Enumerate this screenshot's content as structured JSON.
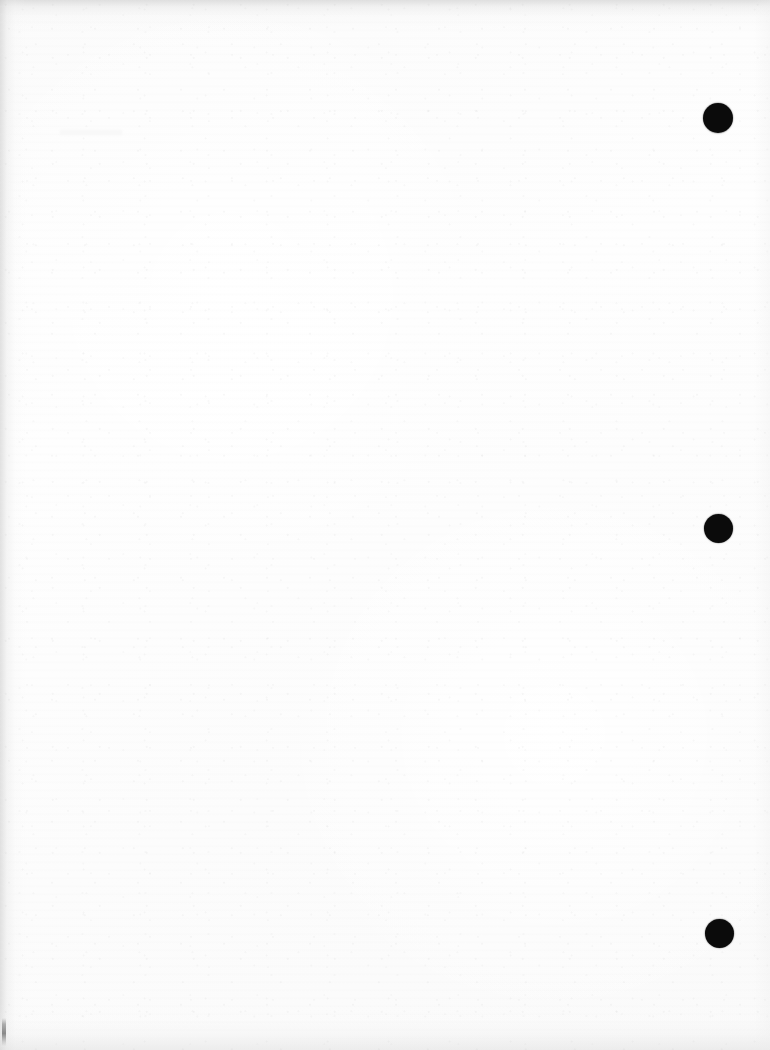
{
  "document": {
    "kind": "scanned-page",
    "description": "Blank scanned sheet with registration marks",
    "page_width": 770,
    "page_height": 1050,
    "visible_text": "",
    "background_color": "#fdfdfd",
    "mark_color": "#0b0b0b",
    "edge_shadow_color": "#cdcdcd"
  },
  "marks": {
    "label": "registration-dots",
    "count": 3,
    "shape": "circle",
    "color": "#0b0b0b",
    "items": [
      {
        "id": "dot-1",
        "cx": 718,
        "cy": 118,
        "r": 15,
        "diameter": 30
      },
      {
        "id": "dot-2",
        "cx": 718,
        "cy": 528,
        "r": 14.5,
        "diameter": 29
      },
      {
        "id": "dot-3",
        "cx": 719,
        "cy": 933,
        "r": 14.5,
        "diameter": 29
      }
    ]
  },
  "edge_artifacts": {
    "tick": {
      "id": "edge-tick-left",
      "x": 2,
      "y": 1018,
      "width": 4,
      "height": 28
    },
    "smudge": {
      "id": "smudge-upper-left",
      "x": 60,
      "y": 130,
      "width": 62,
      "height": 5
    }
  }
}
